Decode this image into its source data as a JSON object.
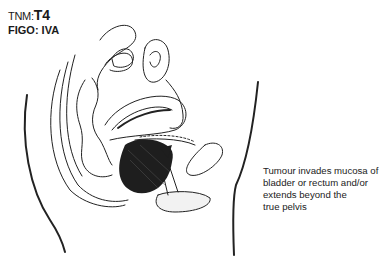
{
  "labels": {
    "tnm_prefix": "TNM:",
    "tnm_value": "T4",
    "figo": "FIGO: IVA"
  },
  "caption": {
    "line1": "Tumour invades mucosa of",
    "line2": "bladder or rectum and/or",
    "line3": "extends beyond the",
    "line4": "true pelvis"
  },
  "illustration": {
    "subject": "sagittal-pelvis-cross-section",
    "tumour_color": "#1e1e1e",
    "line_color": "#222222"
  }
}
